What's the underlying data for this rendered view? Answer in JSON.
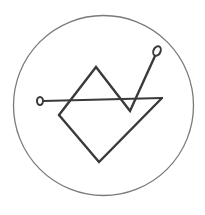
{
  "figure": {
    "colors": {
      "background": "#ffffff",
      "outer_circle": "#7a7a7a",
      "strokes": "#3a3a3a"
    },
    "outer_circle": {
      "cx": 103.5,
      "cy": 105.5,
      "r": 90
    },
    "horizontal_line": {
      "x1": 43,
      "y1": 101,
      "x2": 162,
      "y2": 98
    },
    "left_terminal_circle": {
      "cx": 40,
      "cy": 101,
      "rx": 3,
      "ry": 4
    },
    "sigil_path": "M 59 115 L 96 67 L 130 111 L 155 56",
    "diamond_lower_path": "M 59 115 L 99 162 L 162 98",
    "top_right_terminal_circle": {
      "cx": 157,
      "cy": 51,
      "rx": 3.5,
      "ry": 5
    }
  }
}
